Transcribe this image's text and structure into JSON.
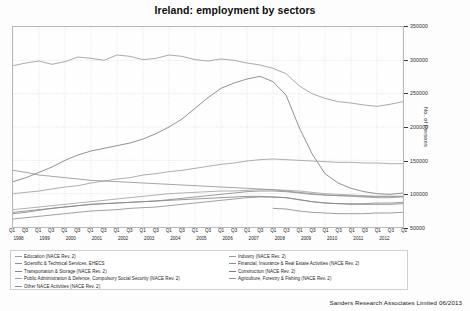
{
  "chart_data": {
    "type": "line",
    "title": "Ireland: employment by sectors",
    "xlabel": "",
    "ylabel": "No. of Persons",
    "ylim": [
      50000,
      350000
    ],
    "yticks": [
      50000,
      100000,
      150000,
      200000,
      250000,
      300000,
      350000
    ],
    "grid": true,
    "legend_position": "bottom",
    "x_quarter_labels": [
      "Q1",
      "Q3",
      "Q1",
      "Q3",
      "Q1",
      "Q3",
      "Q1",
      "Q3",
      "Q1",
      "Q3",
      "Q1",
      "Q3",
      "Q1",
      "Q3",
      "Q1",
      "Q3",
      "Q1",
      "Q3",
      "Q1",
      "Q3",
      "Q1",
      "Q3",
      "Q1",
      "Q3",
      "Q1",
      "Q3",
      "Q1",
      "Q3",
      "Q1",
      "Q3",
      "Q1"
    ],
    "x_year_labels": [
      "1998",
      "1999",
      "2000",
      "2001",
      "2002",
      "2003",
      "2004",
      "2005",
      "2006",
      "2007",
      "2008",
      "2009",
      "2010",
      "2011",
      "2012"
    ],
    "x": [
      "1998Q1",
      "1998Q3",
      "1999Q1",
      "1999Q3",
      "2000Q1",
      "2000Q3",
      "2001Q1",
      "2001Q3",
      "2002Q1",
      "2002Q3",
      "2003Q1",
      "2003Q3",
      "2004Q1",
      "2004Q3",
      "2005Q1",
      "2005Q3",
      "2006Q1",
      "2006Q3",
      "2007Q1",
      "2007Q3",
      "2008Q1",
      "2008Q3",
      "2009Q1",
      "2009Q3",
      "2010Q1",
      "2010Q3",
      "2011Q1",
      "2011Q3",
      "2012Q1",
      "2012Q3",
      "2013Q1"
    ],
    "series": [
      {
        "name": "Industry (NACE Rev. 2)",
        "color": "#9a9a9a",
        "values": [
          292000,
          296000,
          299000,
          294000,
          298000,
          305000,
          303000,
          300000,
          308000,
          306000,
          301000,
          303000,
          308000,
          306000,
          301000,
          299000,
          302000,
          300000,
          296000,
          293000,
          288000,
          280000,
          262000,
          250000,
          243000,
          238000,
          236000,
          233000,
          231000,
          234000,
          238000
        ]
      },
      {
        "name": "Construction (NACE Rev. 2)",
        "color": "#7d7d7d",
        "values": [
          118000,
          124000,
          132000,
          140000,
          150000,
          158000,
          164000,
          168000,
          172000,
          176000,
          182000,
          190000,
          200000,
          212000,
          228000,
          244000,
          258000,
          266000,
          272000,
          276000,
          268000,
          248000,
          200000,
          160000,
          130000,
          116000,
          108000,
          103000,
          100000,
          99000,
          101000
        ]
      },
      {
        "name": "Education (NACE Rev. 2)",
        "color": "#9e9e9e",
        "values": [
          100000,
          102000,
          104000,
          107000,
          110000,
          112000,
          116000,
          119000,
          122000,
          124000,
          128000,
          130000,
          133000,
          135000,
          138000,
          141000,
          144000,
          146000,
          149000,
          151000,
          152000,
          151000,
          150000,
          149000,
          148000,
          147000,
          147000,
          146000,
          146000,
          145000,
          145000
        ]
      },
      {
        "name": "Financial, Insurance & Real Estate Activities (NACE Rev. 2)",
        "color": "#8c8c8c",
        "values": [
          70000,
          72000,
          75000,
          78000,
          80000,
          82000,
          84000,
          85000,
          86000,
          87000,
          88000,
          89000,
          91000,
          93000,
          95000,
          97000,
          99000,
          101000,
          103000,
          104000,
          104000,
          103000,
          101000,
          99000,
          98000,
          97000,
          97000,
          96000,
          96000,
          96000,
          96000
        ]
      },
      {
        "name": "Scientific & Technical Services, EHECS",
        "color": "#8f8f8f",
        "values": [
          62000,
          64000,
          66000,
          68000,
          70000,
          72000,
          74000,
          75000,
          76000,
          78000,
          79000,
          80000,
          82000,
          84000,
          86000,
          88000,
          90000,
          92000,
          94000,
          95000,
          95000,
          94000,
          91000,
          88000,
          86000,
          85000,
          85000,
          85000,
          86000,
          86000,
          87000
        ]
      },
      {
        "name": "Transportation & Storage (NACE Rev. 2)",
        "color": "#858585",
        "values": [
          72000,
          74000,
          76000,
          78000,
          80000,
          82000,
          84000,
          85000,
          86000,
          87000,
          88000,
          89000,
          90000,
          91000,
          92000,
          93000,
          94000,
          95000,
          96000,
          96000,
          95000,
          94000,
          91000,
          88000,
          86000,
          85000,
          84000,
          84000,
          84000,
          84000,
          85000
        ]
      },
      {
        "name": "Public Administration & Defence, Compulsory Social Security (NACE Rev. 2)",
        "color": "#a2a2a2",
        "values": [
          76000,
          78000,
          80000,
          82000,
          84000,
          86000,
          88000,
          90000,
          92000,
          94000,
          96000,
          98000,
          100000,
          101000,
          102000,
          103000,
          104000,
          104000,
          105000,
          106000,
          106000,
          105000,
          104000,
          102000,
          100000,
          99000,
          98000,
          97000,
          96000,
          96000,
          96000
        ]
      },
      {
        "name": "Agriculture, Forestry & Fishing (NACE Rev. 2)",
        "color": "#949494",
        "values": [
          135000,
          132000,
          128000,
          126000,
          124000,
          122000,
          120000,
          119000,
          118000,
          117000,
          116000,
          115000,
          114000,
          113000,
          112000,
          111000,
          110000,
          109000,
          108000,
          107000,
          106000,
          104000,
          102000,
          100000,
          98000,
          97000,
          96000,
          95000,
          94000,
          94000,
          95000
        ]
      },
      {
        "name": "Other NACE Activities (NACE Rev. 2)",
        "color": "#8b8b8b",
        "values": [
          null,
          null,
          null,
          null,
          null,
          null,
          null,
          null,
          null,
          null,
          null,
          null,
          null,
          null,
          null,
          null,
          null,
          null,
          null,
          null,
          78000,
          77000,
          74000,
          72000,
          71000,
          70000,
          70000,
          70000,
          71000,
          71000,
          72000
        ]
      }
    ]
  },
  "legend": {
    "left_column": [
      "Education (NACE Rev. 2)",
      "Scientific & Technical Services, EHECS",
      "Transportation & Storage (NACE Rev. 2)",
      "Public Administration & Defence, Compulsory Social Security (NACE Rev. 2)",
      "Other NACE Activities (NACE Rev. 2)"
    ],
    "right_column": [
      "Industry (NACE Rev. 2)",
      "Financial, Insurance & Real Estate Activities (NACE Rev. 2)",
      "Construction (NACE Rev. 2)",
      "Agriculture, Forestry & Fishing (NACE Rev. 2)"
    ]
  },
  "footer": {
    "credit": "Sanders Research Associates Limited 06/2013"
  }
}
